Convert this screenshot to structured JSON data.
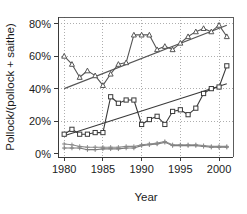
{
  "chart_data": {
    "type": "line",
    "title": "",
    "xlabel": "Year",
    "ylabel": "Pollock/(pollock + saithe)",
    "xlim": [
      1979.2,
      2001.8
    ],
    "ylim": [
      -2,
      84
    ],
    "xticks": [
      1980,
      1985,
      1990,
      1995,
      2000
    ],
    "xtick_labels": [
      "1980",
      "1985",
      "1990",
      "1995",
      "2000"
    ],
    "yticks": [
      0,
      20,
      40,
      60,
      80
    ],
    "ytick_labels": [
      "0%",
      "20%",
      "40%",
      "60%",
      "80%"
    ],
    "grid": true,
    "grid_style": "dotted",
    "legend": "none",
    "x": [
      1980,
      1981,
      1982,
      1983,
      1984,
      1985,
      1986,
      1987,
      1988,
      1989,
      1990,
      1991,
      1992,
      1993,
      1994,
      1995,
      1996,
      1997,
      1998,
      1999,
      2000,
      2001
    ],
    "series": [
      {
        "name": "upper-series",
        "marker": "triangle",
        "color": "#555555",
        "values": [
          60,
          55,
          47,
          51,
          48,
          42,
          49,
          55,
          56,
          73,
          73,
          73,
          64,
          66,
          64,
          68,
          72,
          75,
          77,
          75,
          79,
          72
        ]
      },
      {
        "name": "middle-series",
        "marker": "square",
        "color": "#3a3a3a",
        "values": [
          12,
          15,
          12,
          12,
          13,
          13,
          35,
          31,
          33,
          33,
          18,
          21,
          23,
          18,
          26,
          27,
          24,
          28,
          37,
          40,
          41,
          54
        ]
      },
      {
        "name": "lower-series",
        "marker": "plus",
        "color": "#7a7a7a",
        "values": [
          3.5,
          3.5,
          3.5,
          2.5,
          2.5,
          3,
          3,
          3,
          3.5,
          3.5,
          5,
          5.5,
          6,
          7,
          5,
          5,
          5,
          5,
          4.5,
          4,
          4,
          4
        ]
      },
      {
        "name": "upper-series-secondary",
        "marker": "plus",
        "color": "#8a8a8a",
        "values": [
          6,
          5.5,
          4.5,
          4,
          4,
          4,
          4,
          4,
          4.5,
          4.5,
          5.5,
          6,
          6.5,
          7.5,
          5.5,
          5.5,
          5.5,
          5.5,
          5,
          4.5,
          4.5,
          4.5
        ]
      }
    ],
    "trend_lines": [
      {
        "name": "upper-trend",
        "color": "#555555",
        "x": [
          1980,
          2001
        ],
        "values": [
          40,
          79
        ]
      },
      {
        "name": "middle-trend",
        "color": "#3a3a3a",
        "x": [
          1980,
          2001
        ],
        "values": [
          11,
          43
        ]
      }
    ]
  },
  "colors": {
    "axis": "#3a3a3a",
    "grid": "#9a9a9a",
    "background": "#ffffff",
    "text": "#1c1c1c"
  }
}
